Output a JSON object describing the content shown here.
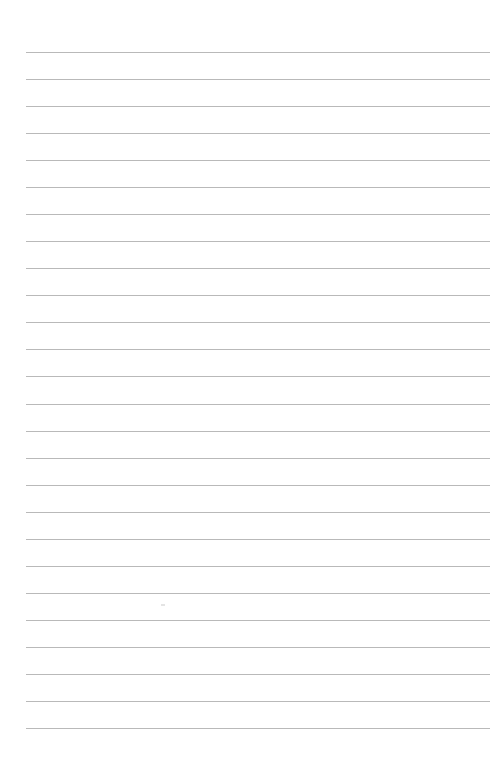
{
  "page": {
    "type": "lined-paper",
    "background_color": "#ffffff",
    "line_color": "#b9b9b9",
    "line_count": 26,
    "first_line_y": 52,
    "line_spacing": 27.04,
    "line_left": 26,
    "line_right": 490
  }
}
